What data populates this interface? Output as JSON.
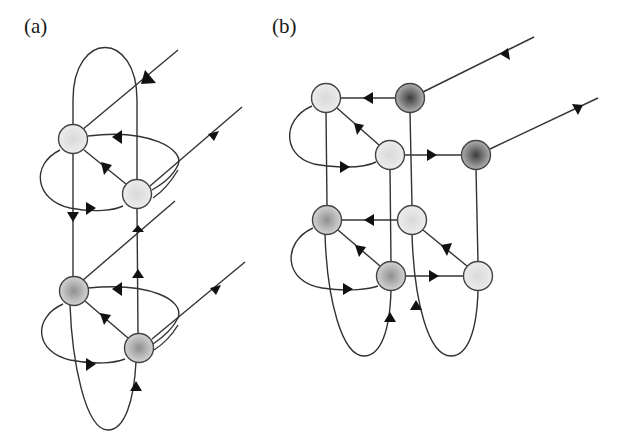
{
  "panels": [
    {
      "label": "(a)",
      "label_pos": [
        24,
        14
      ]
    },
    {
      "label": "(b)",
      "label_pos": [
        272,
        14
      ]
    }
  ],
  "colors": {
    "stroke": "#333333",
    "arrow": "#111111",
    "node_light": "#e6e6e6",
    "node_medium": "#a8a8a8",
    "node_dark": "#5c5c5c"
  },
  "nodes_a": [
    {
      "id": "a1",
      "x": 73,
      "y": 139,
      "shade": "light"
    },
    {
      "id": "a2",
      "x": 137,
      "y": 194,
      "shade": "light"
    },
    {
      "id": "a3",
      "x": 74,
      "y": 291,
      "shade": "medium"
    },
    {
      "id": "a4",
      "x": 139,
      "y": 348,
      "shade": "medium"
    }
  ],
  "nodes_b": [
    {
      "id": "b1",
      "x": 326,
      "y": 98,
      "shade": "light"
    },
    {
      "id": "b2",
      "x": 410,
      "y": 98,
      "shade": "dark"
    },
    {
      "id": "b3",
      "x": 390,
      "y": 155,
      "shade": "light"
    },
    {
      "id": "b4",
      "x": 476,
      "y": 155,
      "shade": "dark"
    },
    {
      "id": "b5",
      "x": 327,
      "y": 220,
      "shade": "medium"
    },
    {
      "id": "b6",
      "x": 412,
      "y": 220,
      "shade": "light"
    },
    {
      "id": "b7",
      "x": 391,
      "y": 276,
      "shade": "medium"
    },
    {
      "id": "b8",
      "x": 478,
      "y": 276,
      "shade": "light"
    }
  ]
}
